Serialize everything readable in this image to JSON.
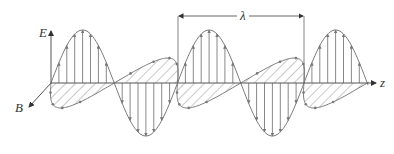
{
  "diagram": {
    "labels": {
      "e_axis": "E",
      "b_axis": "B",
      "z_axis": "z",
      "wavelength": "λ"
    },
    "colors": {
      "line": "#7a7a7a",
      "text": "#333333",
      "background": "#ffffff"
    },
    "geometry": {
      "axis_y": 83,
      "origin_x": 51,
      "z_end_x": 376,
      "e_amplitude": 53,
      "b_amplitude": 25,
      "b_skew": 22,
      "wavelength_px": 126.5,
      "start_phase_x": 51,
      "end_x": 368,
      "lambda_x1": 178,
      "lambda_x2": 304,
      "lambda_y": 16
    }
  }
}
